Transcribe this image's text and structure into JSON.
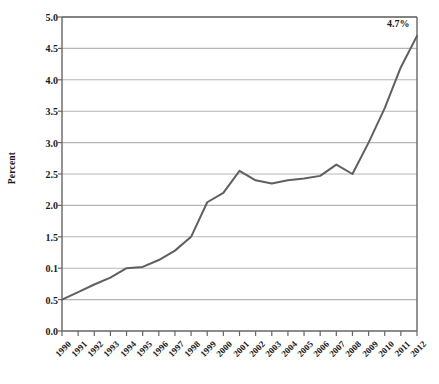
{
  "chart_data": {
    "type": "line",
    "title": "",
    "subtitle": "",
    "xlabel": "",
    "ylabel": "Percent",
    "x": [
      1990,
      1991,
      1992,
      1993,
      1994,
      1995,
      1996,
      1997,
      1998,
      1999,
      2000,
      2001,
      2002,
      2003,
      2004,
      2005,
      2006,
      2007,
      2008,
      2009,
      2010,
      2011,
      2012
    ],
    "categories": [
      "1990",
      "1991",
      "1992",
      "1993",
      "1994",
      "1995",
      "1996",
      "1997",
      "1998",
      "1999",
      "2000",
      "2001",
      "2002",
      "2003",
      "2004",
      "2005",
      "2006",
      "2007",
      "2008",
      "2009",
      "2010",
      "2011",
      "2012"
    ],
    "values": [
      0.5,
      0.62,
      0.74,
      0.85,
      1.0,
      1.02,
      1.13,
      1.28,
      1.5,
      2.05,
      2.2,
      2.55,
      2.4,
      2.35,
      2.4,
      2.43,
      2.47,
      2.65,
      2.5,
      3.0,
      3.55,
      4.2,
      4.7
    ],
    "series": [
      {
        "name": "Percent",
        "values": [
          0.5,
          0.62,
          0.74,
          0.85,
          1.0,
          1.02,
          1.13,
          1.28,
          1.5,
          2.05,
          2.2,
          2.55,
          2.4,
          2.35,
          2.4,
          2.43,
          2.47,
          2.65,
          2.5,
          3.0,
          3.55,
          4.2,
          4.7
        ]
      }
    ],
    "ylim": [
      0.0,
      5.0
    ],
    "ytick_values": [
      0.0,
      0.5,
      1.0,
      1.5,
      2.0,
      2.5,
      3.0,
      3.5,
      4.0,
      4.5,
      5.0
    ],
    "ytick_labels": [
      "0.0",
      "0.5",
      "0.1",
      "1.5",
      "2.0",
      "2.5",
      "3.0",
      "3.5",
      "4.0",
      "4.5",
      "5.0"
    ],
    "grid": true,
    "grid_axis": "y",
    "legend": false,
    "legend_position": "none",
    "annotations": [
      {
        "text": "4.7%",
        "x": 2012,
        "y": 4.7
      }
    ],
    "line_color": "#5f5f5f",
    "grid_color": "#b5b5b5",
    "axis_color": "#666666",
    "background_color": "#ffffff",
    "text_color": "#1a1a1a"
  }
}
